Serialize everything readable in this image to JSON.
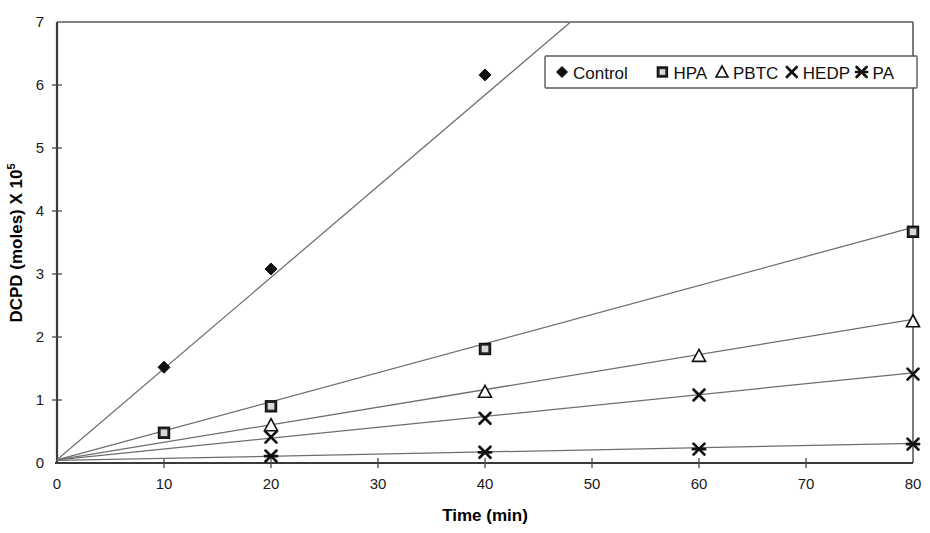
{
  "chart_data": {
    "type": "line",
    "title": "",
    "xlabel": "Time (min)",
    "ylabel": "DCPD (moles) X 10",
    "ylabel_superscript": "5",
    "xlim": [
      0,
      80
    ],
    "ylim": [
      0,
      7
    ],
    "xticks": [
      0,
      10,
      20,
      30,
      40,
      50,
      60,
      70,
      80
    ],
    "yticks": [
      0,
      1,
      2,
      3,
      4,
      5,
      6,
      7
    ],
    "xtick_labels": [
      "0",
      "10",
      "20",
      "30",
      "40",
      "50",
      "60",
      "70",
      "80"
    ],
    "ytick_labels": [
      "0",
      "1",
      "2",
      "3",
      "4",
      "5",
      "6",
      "7"
    ],
    "grid": false,
    "legend_position": "top-right",
    "legend_entries": [
      "Control",
      "HPA",
      "PBTC",
      "HEDP",
      "PA"
    ],
    "series": [
      {
        "name": "Control",
        "marker": "diamond",
        "x": [
          0,
          10,
          20,
          40
        ],
        "values": [
          0.05,
          1.52,
          3.08,
          6.16
        ],
        "trend_x": [
          0,
          48
        ],
        "trend_y": [
          0.05,
          7.0
        ]
      },
      {
        "name": "HPA",
        "marker": "square",
        "x": [
          0,
          10,
          20,
          40,
          80
        ],
        "values": [
          0.05,
          0.48,
          0.9,
          1.81,
          3.67
        ],
        "trend_x": [
          0,
          80
        ],
        "trend_y": [
          0.05,
          3.74
        ]
      },
      {
        "name": "PBTC",
        "marker": "triangle",
        "x": [
          0,
          20,
          40,
          60,
          80
        ],
        "values": [
          0.05,
          0.6,
          1.13,
          1.7,
          2.25
        ],
        "trend_x": [
          0,
          80
        ],
        "trend_y": [
          0.05,
          2.28
        ]
      },
      {
        "name": "HEDP",
        "marker": "cross",
        "x": [
          0,
          20,
          40,
          60,
          80
        ],
        "values": [
          0.05,
          0.41,
          0.71,
          1.08,
          1.41
        ],
        "trend_x": [
          0,
          80
        ],
        "trend_y": [
          0.05,
          1.43
        ]
      },
      {
        "name": "PA",
        "marker": "star",
        "x": [
          0,
          20,
          40,
          60,
          80
        ],
        "values": [
          0.05,
          0.11,
          0.17,
          0.22,
          0.3
        ],
        "trend_x": [
          0,
          80
        ],
        "trend_y": [
          0.04,
          0.31
        ]
      }
    ],
    "colors": {
      "axis": "#3a3a3a",
      "line": "#6e6e6e",
      "marker": "#101010",
      "background": "#ffffff"
    }
  }
}
